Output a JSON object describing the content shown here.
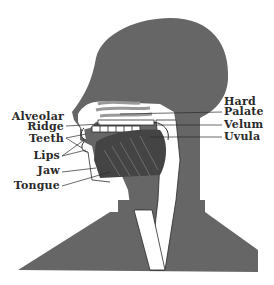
{
  "figure": {
    "type": "sagittal-section-head",
    "colors": {
      "head_fill": "#666666",
      "background": "#ffffff",
      "lines": "#2a2a2a"
    }
  },
  "labels": {
    "left": [
      {
        "id": "alveolar",
        "text": "Alveolar"
      },
      {
        "id": "ridge",
        "text": "Ridge"
      },
      {
        "id": "teeth",
        "text": "Teeth"
      },
      {
        "id": "lips",
        "text": "Lips"
      },
      {
        "id": "jaw",
        "text": "Jaw"
      },
      {
        "id": "tongue",
        "text": "Tongue"
      }
    ],
    "right": [
      {
        "id": "hard",
        "text": "Hard"
      },
      {
        "id": "palate",
        "text": "Palate"
      },
      {
        "id": "velum",
        "text": "Velum"
      },
      {
        "id": "uvula",
        "text": "Uvula"
      }
    ]
  }
}
